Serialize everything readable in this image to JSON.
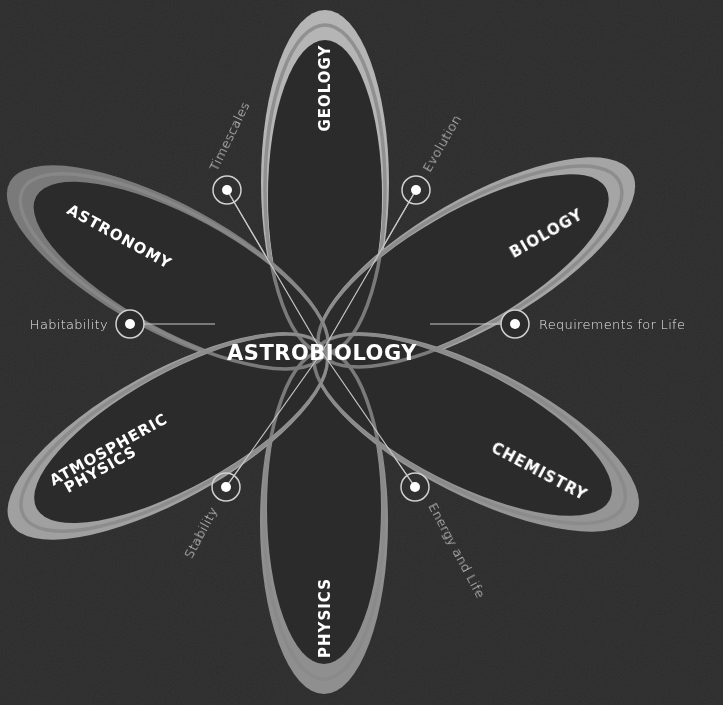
{
  "diagram": {
    "center_label": "ASTROBIOLOGY",
    "background_color": "#2b2b2b",
    "petal_color": "#9a9a9a",
    "petal_tip_color": "#b8b8b8",
    "text_color": "#ffffff",
    "petals": [
      {
        "label": "GEOLOGY",
        "direction": "up"
      },
      {
        "label": "BIOLOGY",
        "direction": "up-right"
      },
      {
        "label": "CHEMISTRY",
        "direction": "down-right"
      },
      {
        "label": "PHYSICS",
        "direction": "down"
      },
      {
        "label": "ATMOSPHERIC",
        "label_line2": "PHYSICS",
        "direction": "down-left"
      },
      {
        "label": "ASTRONOMY",
        "direction": "up-left"
      }
    ],
    "callouts": [
      {
        "label": "Timescales"
      },
      {
        "label": "Evolution"
      },
      {
        "label": "Habitability"
      },
      {
        "label": "Requirements for Life"
      },
      {
        "label": "Stability"
      },
      {
        "label": "Energy and Life"
      }
    ]
  }
}
